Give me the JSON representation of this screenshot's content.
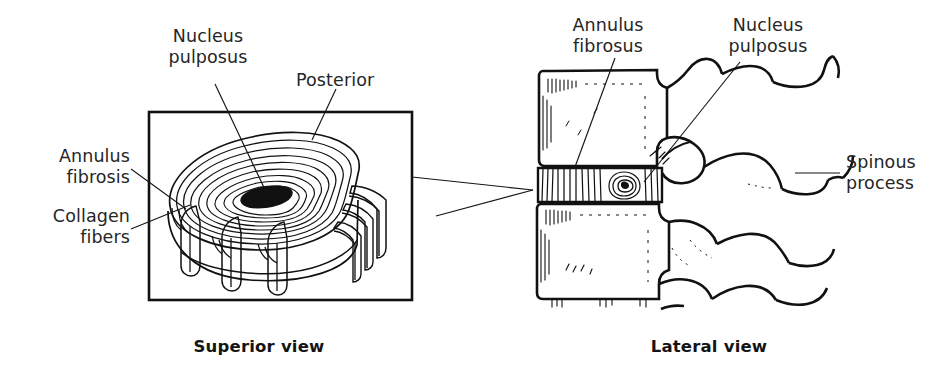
{
  "figure": {
    "background_color": "#ffffff",
    "ink_color": "#111111",
    "text_color": "#262626"
  },
  "superior_view": {
    "caption": "Superior view",
    "labels": {
      "nucleus_pulposus": "Nucleus\npulposus",
      "nucleus_pulposus_line1": "Nucleus",
      "nucleus_pulposus_line2": "pulposus",
      "posterior": "Posterior",
      "annulus_fibrosis_line1": "Annulus",
      "annulus_fibrosis_line2": "fibrosis",
      "collagen_fibers_line1": "Collagen",
      "collagen_fibers_line2": "fibers"
    },
    "frame": {
      "x": 149,
      "y": 112,
      "width": 263,
      "height": 188
    }
  },
  "lateral_view": {
    "caption": "Lateral view",
    "labels": {
      "annulus_fibrosus_line1": "Annulus",
      "annulus_fibrosus_line2": "fibrosus",
      "nucleus_pulposus_line1": "Nucleus",
      "nucleus_pulposus_line2": "pulposus",
      "spinous_process_line1": "Spinous",
      "spinous_process_line2": "process"
    }
  }
}
